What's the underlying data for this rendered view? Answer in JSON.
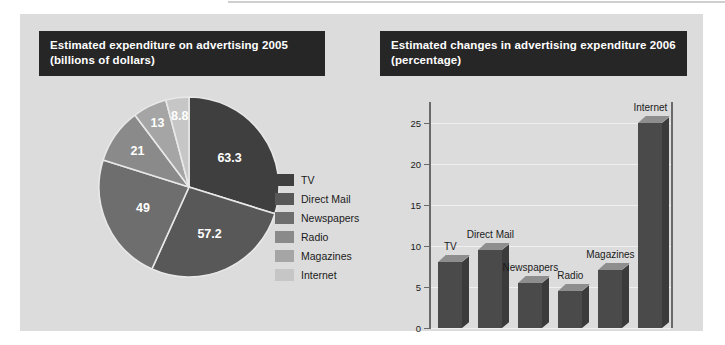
{
  "pie_panel": {
    "title_line1": "Estimated expenditure on advertising 2005",
    "title_line2": "(billions of dollars)"
  },
  "bar_panel": {
    "title_line1": "Estimated changes in advertising expenditure 2006",
    "title_line2": "(percentage)"
  },
  "colors": {
    "panel_background": "#dcdcdc",
    "title_bar": "#262626",
    "title_text": "#ffffff",
    "bar_front": "#4a4a4a",
    "bar_top": "#8e8e8e",
    "bar_side": "#3b3b3b",
    "axis": "#6a6a6a",
    "gridline": "#efefef"
  },
  "chart_data": [
    {
      "type": "pie",
      "title": "Estimated expenditure on advertising 2005 (billions of dollars)",
      "unit": "billions of dollars",
      "labels": [
        "TV",
        "Direct Mail",
        "Newspapers",
        "Radio",
        "Magazines",
        "Internet"
      ],
      "values": [
        63.3,
        57.2,
        49,
        21,
        13,
        8.8
      ],
      "value_labels": [
        "63.3",
        "57.2",
        "49",
        "21",
        "13",
        "8.8"
      ],
      "slice_colors": [
        "#3f3f3f",
        "#585858",
        "#6e6e6e",
        "#8a8a8a",
        "#a5a5a5",
        "#c6c6c6"
      ],
      "legend_position": "right",
      "start_angle_deg": 0,
      "direction": "clockwise"
    },
    {
      "type": "bar",
      "title": "Estimated changes in advertising expenditure 2006 (percentage)",
      "categories": [
        "TV",
        "Direct Mail",
        "Newspapers",
        "Radio",
        "Magazines",
        "Internet"
      ],
      "values": [
        8,
        9.5,
        5.5,
        4.5,
        7,
        25
      ],
      "xlabel": "",
      "ylabel": "",
      "ylim": [
        0,
        27.5
      ],
      "yticks": [
        0,
        5,
        10,
        15,
        20,
        25
      ],
      "ytick_labels": [
        "0",
        "5",
        "10",
        "15",
        "20",
        "25"
      ],
      "grid": true,
      "legend_position": "none",
      "style": "3d-column"
    }
  ]
}
